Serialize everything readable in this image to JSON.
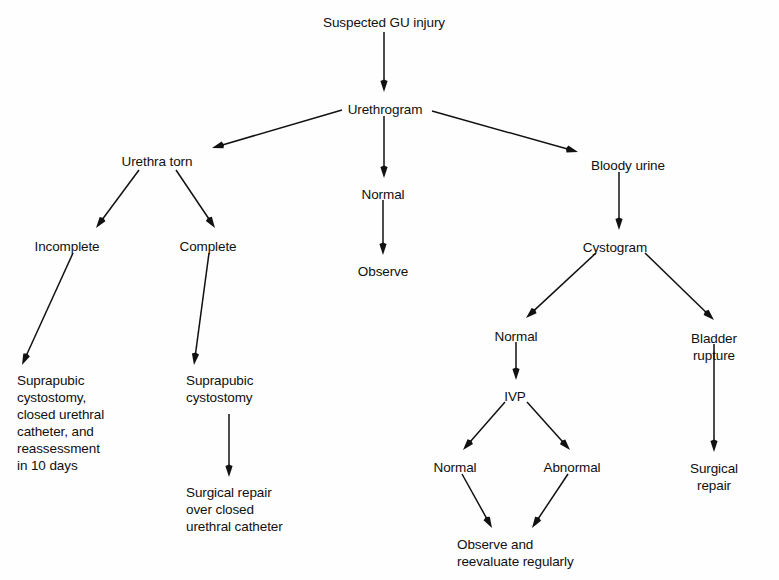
{
  "diagram": {
    "type": "flowchart",
    "background_color": "#fefefe",
    "text_color": "#101010",
    "arrow_color": "#111111",
    "nodes": [
      {
        "id": "suspected",
        "label": "Suspected GU injury",
        "x": 384,
        "y": 14,
        "align": "center"
      },
      {
        "id": "urethrogram",
        "label": "Urethrogram",
        "x": 385,
        "y": 101,
        "align": "center"
      },
      {
        "id": "urethra_torn",
        "label": "Urethra torn",
        "x": 157,
        "y": 153,
        "align": "center"
      },
      {
        "id": "normal_ureth",
        "label": "Normal",
        "x": 383,
        "y": 186,
        "align": "center"
      },
      {
        "id": "bloody_urine",
        "label": "Bloody urine",
        "x": 628,
        "y": 157,
        "align": "center"
      },
      {
        "id": "incomplete",
        "label": "Incomplete",
        "x": 67,
        "y": 238,
        "align": "center"
      },
      {
        "id": "complete",
        "label": "Complete",
        "x": 208,
        "y": 238,
        "align": "center"
      },
      {
        "id": "observe_mid",
        "label": "Observe",
        "x": 383,
        "y": 263,
        "align": "center"
      },
      {
        "id": "cystogram",
        "label": "Cystogram",
        "x": 615,
        "y": 239,
        "align": "center"
      },
      {
        "id": "normal_cysto",
        "label": "Normal",
        "x": 516,
        "y": 328,
        "align": "center"
      },
      {
        "id": "bladder_rupture",
        "label": "Bladder rupture",
        "x": 714,
        "y": 330,
        "align": "center"
      },
      {
        "id": "suprapubic_left",
        "label": "Suprapubic\ncystostomy,\nclosed urethral\ncatheter, and\nreassessment\nin 10 days",
        "x": 17,
        "y": 372,
        "align": "left"
      },
      {
        "id": "suprapubic_mid",
        "label": "Suprapubic\ncystostomy",
        "x": 186,
        "y": 372,
        "align": "left"
      },
      {
        "id": "ivp",
        "label": "IVP",
        "x": 515,
        "y": 388,
        "align": "center"
      },
      {
        "id": "normal_ivp",
        "label": "Normal",
        "x": 455,
        "y": 459,
        "align": "center"
      },
      {
        "id": "abnormal_ivp",
        "label": "Abnormal",
        "x": 572,
        "y": 459,
        "align": "center"
      },
      {
        "id": "surgical_rep_mid",
        "label": "Surgical repair\nover closed\nurethral catheter",
        "x": 186,
        "y": 484,
        "align": "left"
      },
      {
        "id": "surgical_rep_rt",
        "label": "Surgical repair",
        "x": 714,
        "y": 460,
        "align": "center"
      },
      {
        "id": "observe_reeval",
        "label": "Observe and\nreevaluate regularly",
        "x": 457,
        "y": 536,
        "align": "left"
      }
    ],
    "edges": [
      {
        "id": "e-suspected-urethrogram",
        "from": "suspected",
        "to": "urethrogram",
        "x1": 384,
        "y1": 32,
        "x2": 384,
        "y2": 92
      },
      {
        "id": "e-urethrogram-torn",
        "from": "urethrogram",
        "to": "urethra_torn",
        "x1": 342,
        "y1": 110,
        "x2": 212,
        "y2": 148
      },
      {
        "id": "e-urethrogram-normal",
        "from": "urethrogram",
        "to": "normal_ureth",
        "x1": 384,
        "y1": 116,
        "x2": 384,
        "y2": 178
      },
      {
        "id": "e-urethrogram-bloody",
        "from": "urethrogram",
        "to": "bloody_urine",
        "x1": 432,
        "y1": 111,
        "x2": 578,
        "y2": 152
      },
      {
        "id": "e-torn-incomplete",
        "from": "urethra_torn",
        "to": "incomplete",
        "x1": 139,
        "y1": 170,
        "x2": 96,
        "y2": 228
      },
      {
        "id": "e-torn-complete",
        "from": "urethra_torn",
        "to": "complete",
        "x1": 176,
        "y1": 170,
        "x2": 215,
        "y2": 228
      },
      {
        "id": "e-normal-observe",
        "from": "normal_ureth",
        "to": "observe_mid",
        "x1": 383,
        "y1": 200,
        "x2": 383,
        "y2": 255
      },
      {
        "id": "e-bloody-cystogram",
        "from": "bloody_urine",
        "to": "cystogram",
        "x1": 619,
        "y1": 172,
        "x2": 619,
        "y2": 230
      },
      {
        "id": "e-cystogram-normal",
        "from": "cystogram",
        "to": "normal_cysto",
        "x1": 596,
        "y1": 253,
        "x2": 526,
        "y2": 318
      },
      {
        "id": "e-cystogram-rupture",
        "from": "cystogram",
        "to": "bladder_rupture",
        "x1": 645,
        "y1": 253,
        "x2": 714,
        "y2": 320
      },
      {
        "id": "e-incomplete-suprapubic",
        "from": "incomplete",
        "to": "suprapubic_left",
        "x1": 73,
        "y1": 253,
        "x2": 22,
        "y2": 365
      },
      {
        "id": "e-complete-suprapubic",
        "from": "complete",
        "to": "suprapubic_mid",
        "x1": 209,
        "y1": 253,
        "x2": 194,
        "y2": 365
      },
      {
        "id": "e-normal-ivp",
        "from": "normal_cysto",
        "to": "ivp",
        "x1": 516,
        "y1": 342,
        "x2": 516,
        "y2": 380
      },
      {
        "id": "e-ivp-normal",
        "from": "ivp",
        "to": "normal_ivp",
        "x1": 505,
        "y1": 402,
        "x2": 463,
        "y2": 450
      },
      {
        "id": "e-ivp-abnormal",
        "from": "ivp",
        "to": "abnormal_ivp",
        "x1": 527,
        "y1": 402,
        "x2": 570,
        "y2": 450
      },
      {
        "id": "e-suprapubic-surgical",
        "from": "suprapubic_mid",
        "to": "surgical_rep_mid",
        "x1": 229,
        "y1": 414,
        "x2": 229,
        "y2": 477
      },
      {
        "id": "e-rupture-surgical",
        "from": "bladder_rupture",
        "to": "surgical_rep_rt",
        "x1": 714,
        "y1": 344,
        "x2": 714,
        "y2": 452
      },
      {
        "id": "e-normal-observe-reeval",
        "from": "normal_ivp",
        "to": "observe_reeval",
        "x1": 462,
        "y1": 474,
        "x2": 492,
        "y2": 528
      },
      {
        "id": "e-abnormal-observe-reev",
        "from": "abnormal_ivp",
        "to": "observe_reeval",
        "x1": 568,
        "y1": 474,
        "x2": 532,
        "y2": 528
      }
    ]
  }
}
